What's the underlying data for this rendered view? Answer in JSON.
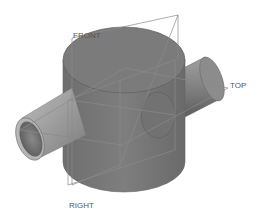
{
  "viewport": {
    "background": "#ffffff",
    "model_color": "#7a7a7a",
    "model_dark": "#5e5e5e",
    "model_light": "#9a9a9a",
    "datum_color": "#808080"
  },
  "datum_planes": [
    {
      "name": "front",
      "label": "FRONT"
    },
    {
      "name": "top",
      "label": "TOP"
    },
    {
      "name": "right",
      "label": "RIGHT"
    }
  ]
}
